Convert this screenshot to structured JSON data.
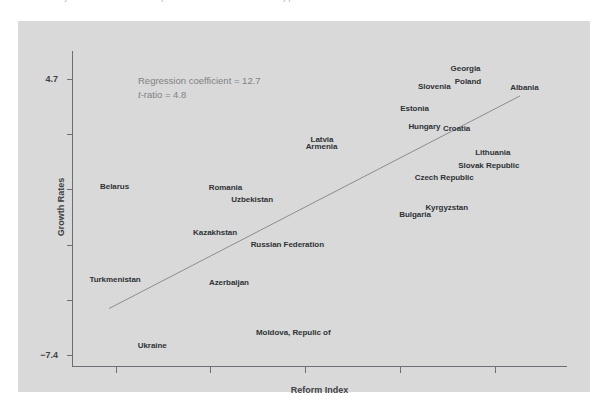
{
  "caption": {
    "text": "Recovery of transition economies compared with the reform index in the early period"
  },
  "annotation": {
    "line1": "Regression coefficient = 12.7",
    "line2_italic": "t",
    "line2_rest": "-ratio = 4.8"
  },
  "colors": {
    "panel": "#d9d9d9",
    "axis": "#6b6f73",
    "label_text": "#2f3337",
    "annotation_text": "#7e8185",
    "regression_line": "#8a8d91"
  },
  "chart_data": {
    "type": "scatter",
    "title": "",
    "xlabel": "Reform Index",
    "ylabel": "Growth Rates",
    "ytick_labels": [
      "4.7",
      "−7.4"
    ],
    "ytick_values": [
      4.7,
      -7.4
    ],
    "ylim": [
      -7.4,
      4.7
    ],
    "xlim": [
      0,
      1
    ],
    "grid": false,
    "legend": null,
    "xtick_count": 5,
    "point_marker": "country-name-label",
    "regression": {
      "coefficient": 12.7,
      "t_ratio": 4.8,
      "line_x": [
        0.075,
        0.905
      ],
      "line_y": [
        -5.35,
        3.95
      ]
    },
    "points": [
      {
        "label": "Georgia",
        "xf": 0.795,
        "yf": 0.055
      },
      {
        "label": "Poland",
        "xf": 0.8,
        "yf": 0.095
      },
      {
        "label": "Slovenia",
        "xf": 0.732,
        "yf": 0.11
      },
      {
        "label": "Albania",
        "xf": 0.914,
        "yf": 0.113
      },
      {
        "label": "Estonia",
        "xf": 0.692,
        "yf": 0.18
      },
      {
        "label": "Hungary",
        "xf": 0.712,
        "yf": 0.238
      },
      {
        "label": "Croatia",
        "xf": 0.777,
        "yf": 0.244
      },
      {
        "label": "Latvia",
        "xf": 0.505,
        "yf": 0.278
      },
      {
        "label": "Armenia",
        "xf": 0.504,
        "yf": 0.302
      },
      {
        "label": "Lithuania",
        "xf": 0.85,
        "yf": 0.32
      },
      {
        "label": "Slovak Republic",
        "xf": 0.842,
        "yf": 0.36
      },
      {
        "label": "Czech Republic",
        "xf": 0.752,
        "yf": 0.4
      },
      {
        "label": "Belarus",
        "xf": 0.086,
        "yf": 0.428
      },
      {
        "label": "Romania",
        "xf": 0.31,
        "yf": 0.43
      },
      {
        "label": "Uzbekistan",
        "xf": 0.364,
        "yf": 0.468
      },
      {
        "label": "Kyrgyzstan",
        "xf": 0.757,
        "yf": 0.493
      },
      {
        "label": "Bulgaria",
        "xf": 0.693,
        "yf": 0.515
      },
      {
        "label": "Kazakhstan",
        "xf": 0.289,
        "yf": 0.573
      },
      {
        "label": "Russian Federation",
        "xf": 0.435,
        "yf": 0.611
      },
      {
        "label": "Turkmenistan",
        "xf": 0.087,
        "yf": 0.723
      },
      {
        "label": "Azerbaijan",
        "xf": 0.317,
        "yf": 0.73
      },
      {
        "label": "Moldova, Repulic of",
        "xf": 0.447,
        "yf": 0.89
      },
      {
        "label": "Ukraine",
        "xf": 0.162,
        "yf": 0.93
      }
    ]
  }
}
